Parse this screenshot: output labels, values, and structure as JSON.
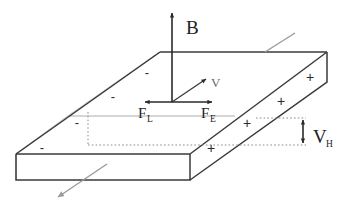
{
  "figure": {
    "labels": {
      "magnetic_field": "B",
      "velocity": "V",
      "lorentz_force": "F",
      "lorentz_force_sub": "L",
      "electric_force": "F",
      "electric_force_sub": "E",
      "hall_voltage": "V",
      "hall_voltage_sub": "H"
    },
    "charges": {
      "negative_symbol": "-",
      "positive_symbol": "+",
      "negative_signs": [
        {
          "x": 147,
          "y": 77
        },
        {
          "x": 113,
          "y": 101
        },
        {
          "x": 77,
          "y": 127
        },
        {
          "x": 42,
          "y": 152
        }
      ],
      "positive_signs": [
        {
          "x": 310,
          "y": 81
        },
        {
          "x": 281,
          "y": 105
        },
        {
          "x": 247,
          "y": 127
        },
        {
          "x": 211,
          "y": 152
        }
      ]
    },
    "colors": {
      "edge": "#3a3a3a",
      "faint_edge": "#c9c9c9",
      "dotted_guide": "#8a8a8a",
      "arrow_dark": "#2a2a2a",
      "arrow_grey": "#9a9a9a",
      "background": "#ffffff",
      "text": "#222222"
    },
    "geometry": {
      "top_face": "160,52 327,52 278,86 190,154 16,154 68,116",
      "front_face": "16,154 190,154 190,180 16,180",
      "right_face": "190,154 278,86 327,52 327,82 235,180 190,180"
    },
    "arrows": {
      "b_field": {
        "from_x": 172,
        "from_y": 102,
        "to_x": 172,
        "to_y": 10
      },
      "velocity": {
        "from_x": 172,
        "from_y": 102,
        "to_x": 208,
        "to_y": 78
      },
      "force_left": {
        "from_x": 172,
        "from_y": 102,
        "to_x": 143,
        "to_y": 102
      },
      "force_right": {
        "from_x": 172,
        "from_y": 102,
        "to_x": 214,
        "to_y": 102
      },
      "current_top": {
        "from_x": 265,
        "from_y": 52,
        "to_x": 297,
        "to_y": 31
      },
      "current_bottom": {
        "from_x": 107,
        "from_y": 164,
        "to_x": 56,
        "to_y": 199
      },
      "hall_gap": {
        "x": 303,
        "top_y": 118,
        "bottom_y": 145
      }
    }
  }
}
